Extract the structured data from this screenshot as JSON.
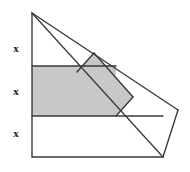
{
  "figure": {
    "background_color": "#ffffff",
    "stroke_color": "#3a3a3a",
    "shade_color": "#c8c8c8",
    "stroke_width": 1.4,
    "width": 190,
    "height": 172,
    "labels": [
      {
        "text": "x",
        "x": 9,
        "y": 43,
        "segment": "top-third-of-left-side"
      },
      {
        "text": "x",
        "x": 9,
        "y": 86,
        "segment": "middle-third-of-left-side"
      },
      {
        "text": "x",
        "x": 9,
        "y": 128,
        "segment": "bottom-third-of-left-side"
      }
    ],
    "points": {
      "apex": [
        32,
        13
      ],
      "left_bottom": [
        32,
        157
      ],
      "bottom_right": [
        163,
        157
      ],
      "right_vertex": [
        178,
        110
      ],
      "band_left_top": [
        32,
        66
      ],
      "band_left_bottom": [
        32,
        116
      ],
      "band_right_top": [
        116,
        66
      ],
      "band_right_bottom": [
        116,
        116
      ],
      "quad_top": [
        94,
        53
      ],
      "quad_right": [
        133,
        97
      ],
      "quad_bottom": [
        116,
        116
      ],
      "quad_left": [
        77,
        72
      ]
    },
    "shaded_regions": [
      {
        "name": "horizontal-band",
        "points": "32,66 116,66 116,116 32,116"
      },
      {
        "name": "tilted-quadrilateral",
        "points": "94,53 133,97 116,116 77,72"
      }
    ],
    "outline_paths": [
      {
        "name": "triangle-outline",
        "points": "32,13 32,157 163,157 32,13"
      },
      {
        "name": "upper-ray-to-right-vertex",
        "points": "32,13 178,110"
      },
      {
        "name": "right-wedge",
        "points": "178,110 163,157"
      },
      {
        "name": "quad-edge-top-left",
        "points": "94,53 77,72"
      },
      {
        "name": "quad-edge-right",
        "points": "94,53 133,97"
      },
      {
        "name": "quad-edge-bottom",
        "points": "133,97 116,116"
      },
      {
        "name": "band-top-edge",
        "points": "32,66 116,66"
      },
      {
        "name": "band-bottom-edge",
        "points": "32,116 116,116"
      }
    ]
  }
}
